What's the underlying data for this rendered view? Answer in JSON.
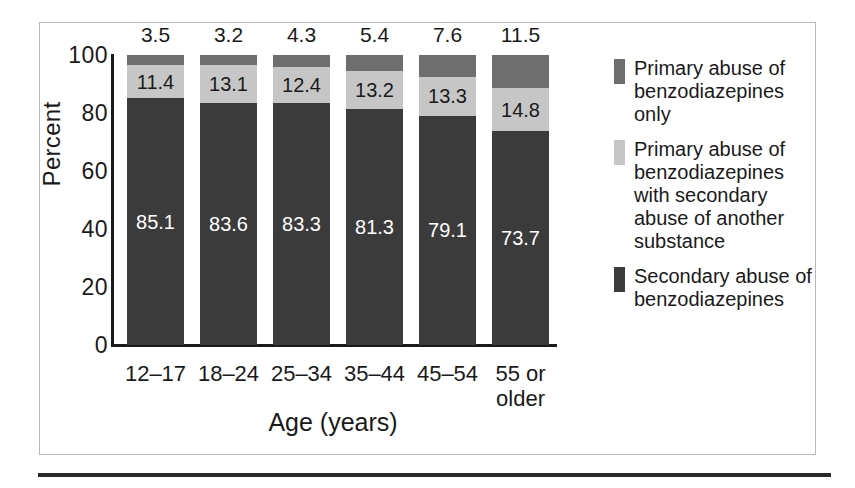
{
  "figure": {
    "has_outer_frame": true,
    "frame_color": "#b8b8b8",
    "bottom_rule_color": "#2a2a2a"
  },
  "chart_data": {
    "type": "bar",
    "subtype": "stacked-bar-100-percent",
    "title": "",
    "xlabel": "Age (years)",
    "ylabel": "Percent",
    "ylim": [
      0,
      100
    ],
    "yticks": [
      0,
      20,
      40,
      60,
      80,
      100
    ],
    "ytick_labels": [
      "0",
      "20",
      "40",
      "60",
      "80",
      "100"
    ],
    "grid": false,
    "legend_position": "right",
    "categories": [
      "12–17",
      "18–24",
      "25–34",
      "35–44",
      "45–54",
      "55 or older"
    ],
    "category_label_lines": [
      [
        "12–17"
      ],
      [
        "18–24"
      ],
      [
        "25–34"
      ],
      [
        "35–44"
      ],
      [
        "45–54"
      ],
      [
        "55 or",
        "older"
      ]
    ],
    "series": [
      {
        "name": "Secondary abuse of benzodiazepines",
        "color": "#3b3b3b",
        "values": [
          85.1,
          83.6,
          83.3,
          81.3,
          79.1,
          73.7
        ],
        "labels_inside": true
      },
      {
        "name": "Primary abuse of benzodiazepines with secondary abuse of another substance",
        "color": "#c6c6c6",
        "values": [
          11.4,
          13.1,
          12.4,
          13.2,
          13.3,
          14.8
        ],
        "labels_inside": true
      },
      {
        "name": "Primary abuse of benzodiazepines only",
        "color": "#6e6e6e",
        "values": [
          3.5,
          3.2,
          4.3,
          5.4,
          7.6,
          11.5
        ],
        "labels_inside": false,
        "labels_above_bar": true
      }
    ]
  },
  "legend": {
    "entries": [
      {
        "color": "#6e6e6e",
        "lines": [
          "Primary abuse of",
          "benzodiazepines",
          "only"
        ],
        "text": "Primary abuse of benzodiazepines only"
      },
      {
        "color": "#c6c6c6",
        "lines": [
          "Primary abuse of",
          "benzodiazepines",
          "with secondary",
          "abuse of another",
          "substance"
        ],
        "text": "Primary abuse of benzodiazepines with secondary abuse of another substance"
      },
      {
        "color": "#3b3b3b",
        "lines": [
          "Secondary abuse of",
          "benzodiazepines"
        ],
        "text": "Secondary abuse of benzodiazepines"
      }
    ]
  }
}
